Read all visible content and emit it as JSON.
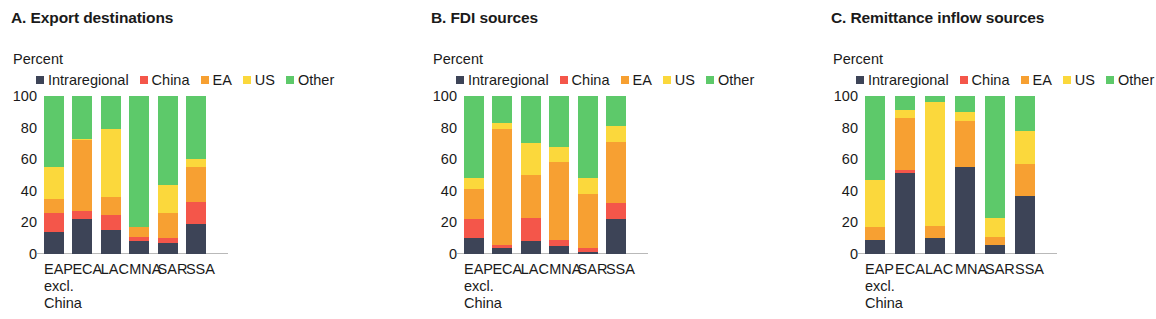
{
  "panels": [
    {
      "id": "a",
      "title": "A. Export destinations",
      "axis_unit": "Percent"
    },
    {
      "id": "b",
      "title": "B. FDI sources",
      "axis_unit": "Percent"
    },
    {
      "id": "c",
      "title": "C. Remittance inflow sources",
      "axis_unit": "Percent"
    }
  ],
  "legend": {
    "entries": [
      {
        "label": "Intraregional",
        "color": "#3d4457"
      },
      {
        "label": "China",
        "color": "#f4564a"
      },
      {
        "label": "EA",
        "color": "#f7a032"
      },
      {
        "label": "US",
        "color": "#fbd83c"
      },
      {
        "label": "Other",
        "color": "#5dc96a"
      }
    ]
  },
  "yticks": [
    "100",
    "80",
    "60",
    "40",
    "20",
    "0"
  ],
  "xlabels": [
    {
      "main": "EAP",
      "sub1": "excl.",
      "sub2": "China"
    },
    {
      "main": "ECA",
      "sub1": "",
      "sub2": ""
    },
    {
      "main": "LAC",
      "sub1": "",
      "sub2": ""
    },
    {
      "main": "MNA",
      "sub1": "",
      "sub2": ""
    },
    {
      "main": "SAR",
      "sub1": "",
      "sub2": ""
    },
    {
      "main": "SSA",
      "sub1": "",
      "sub2": ""
    }
  ],
  "chart_data": [
    {
      "type": "bar",
      "stacked": true,
      "panel": "A",
      "title": "A. Export destinations",
      "xlabel": "",
      "ylabel": "Percent",
      "ylim": [
        0,
        100
      ],
      "yticks": [
        0,
        20,
        40,
        60,
        80,
        100
      ],
      "grid": false,
      "legend_position": "top",
      "categories": [
        "EAP excl. China",
        "ECA",
        "LAC",
        "MNA",
        "SAR",
        "SSA"
      ],
      "series": [
        {
          "name": "Intraregional",
          "color": "#3d4457",
          "values": [
            14,
            22,
            15,
            8,
            7,
            19
          ]
        },
        {
          "name": "China",
          "color": "#f4564a",
          "values": [
            12,
            5,
            10,
            3,
            3,
            14
          ]
        },
        {
          "name": "EA",
          "color": "#f7a032",
          "values": [
            9,
            45,
            11,
            6,
            16,
            22
          ]
        },
        {
          "name": "US",
          "color": "#fbd83c",
          "values": [
            20,
            1,
            43,
            0,
            18,
            5
          ]
        },
        {
          "name": "Other",
          "color": "#5dc96a",
          "values": [
            45,
            27,
            21,
            83,
            56,
            40
          ]
        }
      ]
    },
    {
      "type": "bar",
      "stacked": true,
      "panel": "B",
      "title": "B. FDI sources",
      "xlabel": "",
      "ylabel": "Percent",
      "ylim": [
        0,
        100
      ],
      "yticks": [
        0,
        20,
        40,
        60,
        80,
        100
      ],
      "grid": false,
      "legend_position": "top",
      "categories": [
        "EAP excl. China",
        "ECA",
        "LAC",
        "MNA",
        "SAR",
        "SSA"
      ],
      "series": [
        {
          "name": "Intraregional",
          "color": "#3d4457",
          "values": [
            10,
            4,
            8,
            5,
            1,
            22
          ]
        },
        {
          "name": "China",
          "color": "#f4564a",
          "values": [
            12,
            2,
            15,
            4,
            3,
            10
          ]
        },
        {
          "name": "EA",
          "color": "#f7a032",
          "values": [
            19,
            73,
            27,
            49,
            34,
            39
          ]
        },
        {
          "name": "US",
          "color": "#fbd83c",
          "values": [
            7,
            4,
            20,
            10,
            10,
            10
          ]
        },
        {
          "name": "Other",
          "color": "#5dc96a",
          "values": [
            52,
            17,
            30,
            32,
            52,
            19
          ]
        }
      ]
    },
    {
      "type": "bar",
      "stacked": true,
      "panel": "C",
      "title": "C. Remittance inflow sources",
      "xlabel": "",
      "ylabel": "Percent",
      "ylim": [
        0,
        100
      ],
      "yticks": [
        0,
        20,
        40,
        60,
        80,
        100
      ],
      "grid": false,
      "legend_position": "top",
      "categories": [
        "EAP excl. China",
        "ECA",
        "LAC",
        "MNA",
        "SAR",
        "SSA"
      ],
      "series": [
        {
          "name": "Intraregional",
          "color": "#3d4457",
          "values": [
            9,
            51,
            10,
            55,
            6,
            37
          ]
        },
        {
          "name": "China",
          "color": "#f4564a",
          "values": [
            0,
            2,
            0,
            0,
            0,
            0
          ]
        },
        {
          "name": "EA",
          "color": "#f7a032",
          "values": [
            8,
            33,
            8,
            29,
            5,
            20
          ]
        },
        {
          "name": "US",
          "color": "#fbd83c",
          "values": [
            30,
            5,
            78,
            6,
            12,
            21
          ]
        },
        {
          "name": "Other",
          "color": "#5dc96a",
          "values": [
            53,
            9,
            4,
            10,
            77,
            22
          ]
        }
      ]
    }
  ]
}
